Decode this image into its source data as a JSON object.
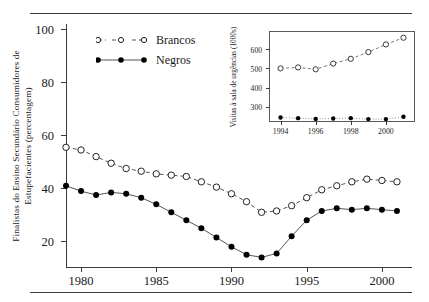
{
  "figure": {
    "top_rule": "horizontal-rule",
    "bottom_rule": "horizontal-rule"
  },
  "chart_data": {
    "type": "line",
    "title": "",
    "xlabel": "",
    "ylabel": "Finalistas do Ensino Secundário Consumidores de Estupefacientes (percentagem)",
    "ylabel_line1": "Finalistas do Ensino Secundário Consumidores de",
    "ylabel_line2": "Estupefacientes (percentagem)",
    "xlim": [
      1979,
      2002
    ],
    "ylim": [
      10,
      102
    ],
    "yticks": [
      20,
      40,
      60,
      80,
      100
    ],
    "xticks": [
      1980,
      1985,
      1990,
      1995,
      2000
    ],
    "grid": false,
    "legend_position": "top-left",
    "x": [
      1979,
      1980,
      1981,
      1982,
      1983,
      1984,
      1985,
      1986,
      1987,
      1988,
      1989,
      1990,
      1991,
      1992,
      1993,
      1994,
      1995,
      1996,
      1997,
      1998,
      1999,
      2000,
      2001
    ],
    "series": [
      {
        "name": "Brancos",
        "marker": "open-circle",
        "linestyle": "dashed",
        "values": [
          55.5,
          54.5,
          52.0,
          49.5,
          47.5,
          46.5,
          45.5,
          45.0,
          44.5,
          42.5,
          40.5,
          38.0,
          35.0,
          31.0,
          31.5,
          33.5,
          36.5,
          39.5,
          41.0,
          42.5,
          43.5,
          43.0,
          42.5
        ]
      },
      {
        "name": "Negros",
        "marker": "filled-circle",
        "linestyle": "solid",
        "values": [
          41.0,
          39.0,
          37.5,
          38.5,
          38.0,
          36.5,
          34.0,
          31.0,
          28.0,
          25.0,
          21.5,
          18.0,
          15.0,
          14.0,
          15.5,
          22.0,
          28.0,
          31.5,
          32.5,
          32.0,
          32.5,
          32.0,
          31.5
        ]
      }
    ]
  },
  "inset_chart_data": {
    "type": "line",
    "title": "",
    "xlabel": "",
    "ylabel": "Visitas à sala de urgências (1000s)",
    "xlim": [
      1993.4,
      2001.6
    ],
    "ylim": [
      225,
      690
    ],
    "yticks": [
      300,
      400,
      500,
      600
    ],
    "xticks": [
      1994,
      1996,
      1998,
      2000
    ],
    "grid": false,
    "x": [
      1994,
      1995,
      1996,
      1997,
      1998,
      1999,
      2000,
      2001
    ],
    "series": [
      {
        "name": "Brancos",
        "marker": "open-circle",
        "linestyle": "dashed",
        "values": [
          500,
          505,
          495,
          525,
          550,
          585,
          625,
          660
        ]
      },
      {
        "name": "Negros",
        "marker": "filled-circle",
        "linestyle": "dotted",
        "values": [
          243,
          240,
          236,
          238,
          240,
          235,
          235,
          247
        ]
      }
    ]
  },
  "legend": {
    "items": [
      {
        "label": "Brancos",
        "marker": "open-circle",
        "linestyle": "dashed"
      },
      {
        "label": "Negros",
        "marker": "filled-circle",
        "linestyle": "solid"
      }
    ]
  },
  "colors": {
    "line": "#555555",
    "marker_fill": "#000000",
    "axis": "#3a3a3a",
    "background": "#ffffff"
  }
}
